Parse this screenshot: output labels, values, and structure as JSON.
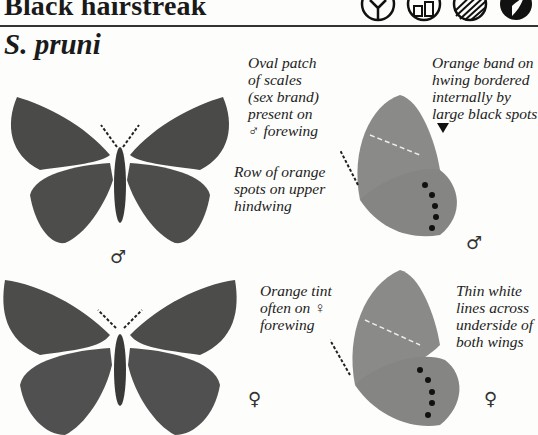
{
  "header": {
    "common_name": "Black hairstreak",
    "scientific_name": "S. pruni",
    "habitat_icons": [
      "tree-icon",
      "building-icon",
      "sunburst-icon",
      "butterfly-silhouette-icon"
    ]
  },
  "annotations": {
    "sex_brand": "Oval patch\nof scales\n(sex brand)\npresent on\n♂ forewing",
    "orange_band": "Orange band on\nhwing bordered\ninternally by\nlarge black spots",
    "orange_spots": "Row of orange\nspots on upper\nhindwing",
    "orange_tint": "Orange tint\noften on ♀\nforewing",
    "white_lines": "Thin white\nlines across\nunderside of\nboth wings"
  },
  "figures": {
    "male_upperside_symbol": "♂",
    "male_underside_symbol": "♂",
    "female_upperside_symbol": "♀",
    "female_underside_symbol": "♀"
  },
  "colors": {
    "wing_dark": "#4a4a48",
    "wing_underside": "#8a8a88",
    "text": "#1a1a1a"
  }
}
